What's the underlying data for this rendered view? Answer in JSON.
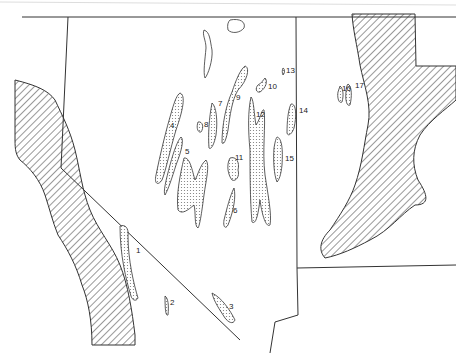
{
  "map": {
    "type": "outline map",
    "legend": {
      "stippled": "lake basins",
      "hatched": "mountain / upland areas"
    },
    "lake_labels": [
      {
        "id": "1",
        "x": 137,
        "y": 253
      },
      {
        "id": "2",
        "x": 172,
        "y": 304
      },
      {
        "id": "3",
        "x": 230,
        "y": 309
      },
      {
        "id": "4",
        "x": 172,
        "y": 127
      },
      {
        "id": "5",
        "x": 186,
        "y": 154
      },
      {
        "id": "6",
        "x": 233,
        "y": 213
      },
      {
        "id": "7",
        "x": 219,
        "y": 106
      },
      {
        "id": "8",
        "x": 206,
        "y": 126
      },
      {
        "id": "9",
        "x": 237,
        "y": 100
      },
      {
        "id": "10",
        "x": 268,
        "y": 89
      },
      {
        "id": "11",
        "x": 235,
        "y": 159
      },
      {
        "id": "12",
        "x": 257,
        "y": 116
      },
      {
        "id": "13",
        "x": 286,
        "y": 72
      },
      {
        "id": "14",
        "x": 299,
        "y": 112
      },
      {
        "id": "15",
        "x": 286,
        "y": 160
      },
      {
        "id": "16",
        "x": 344,
        "y": 90
      },
      {
        "id": "17",
        "x": 357,
        "y": 88
      }
    ],
    "colors": {
      "line": "#333333",
      "stipple": "#bfbfbf",
      "background": "#ffffff"
    }
  }
}
